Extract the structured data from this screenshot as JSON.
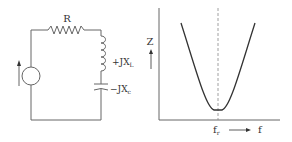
{
  "circuit": {
    "resistor_label": "R",
    "inductor_label": "+JX",
    "inductor_sub": "L",
    "capacitor_label": "−JX",
    "capacitor_sub": "c"
  },
  "graph": {
    "y_label": "Z",
    "x_label": "f",
    "resonance_label": "f",
    "resonance_sub": "r"
  },
  "colors": {
    "line": "#555555",
    "curve": "#333333",
    "text": "#333333"
  }
}
